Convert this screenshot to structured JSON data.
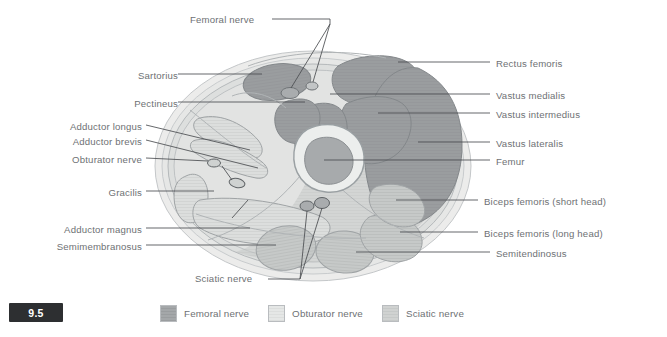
{
  "figure": {
    "number": "9.5",
    "title_alt": "Cross-section of the thigh showing nerve territories"
  },
  "labels_left": [
    {
      "name": "sartorius",
      "text": "Sartorius",
      "x": 118,
      "y": 77,
      "line_to_x": 262,
      "line_to_y": 82
    },
    {
      "name": "pectineus",
      "text": "Pectineus",
      "x": 120,
      "y": 105,
      "line_to_x": 300,
      "line_to_y": 109
    },
    {
      "name": "adductor-longus",
      "text": "Adductor longus",
      "x": 78,
      "y": 128,
      "line_to_x": 242,
      "line_to_y": 148
    },
    {
      "name": "adductor-brevis",
      "text": "Adductor brevis",
      "x": 79,
      "y": 143,
      "line_to_x": 252,
      "line_to_y": 163
    },
    {
      "name": "obturator-nerve",
      "text": "Obturator nerve",
      "x": 78,
      "y": 161,
      "line_to_x": 210,
      "line_to_y": 163
    },
    {
      "name": "gracilis",
      "text": "Gracilis",
      "x": 123,
      "y": 194,
      "line_to_x": 213,
      "line_to_y": 196
    },
    {
      "name": "adductor-magnus",
      "text": "Adductor magnus",
      "x": 70,
      "y": 231,
      "line_to_x": 248,
      "line_to_y": 234
    },
    {
      "name": "semimembranosus",
      "text": "Semimembranosus",
      "x": 66,
      "y": 248,
      "line_to_x": 272,
      "line_to_y": 250
    }
  ],
  "labels_right": [
    {
      "name": "rectus-femoris",
      "text": "Rectus femoris",
      "x": 500,
      "y": 65,
      "line_to_x": 420,
      "line_to_y": 68
    },
    {
      "name": "vastus-medialis",
      "text": "Vastus medialis",
      "x": 500,
      "y": 97,
      "line_to_x": 427,
      "line_to_y": 99
    },
    {
      "name": "vastus-intermedius",
      "text": "Vastus intermedius",
      "x": 500,
      "y": 116,
      "line_to_x": 418,
      "line_to_y": 118
    },
    {
      "name": "vastus-lateralis",
      "text": "Vastus lateralis",
      "x": 500,
      "y": 145,
      "line_to_x": 432,
      "line_to_y": 147
    },
    {
      "name": "femur",
      "text": "Femur",
      "x": 500,
      "y": 163,
      "line_to_x": 340,
      "line_to_y": 163
    },
    {
      "name": "biceps-femoris-short-head",
      "text": "Biceps femoris (short head)",
      "x": 489,
      "y": 203,
      "line_to_x": 408,
      "line_to_y": 205
    },
    {
      "name": "biceps-femoris-long-head",
      "text": "Biceps femoris (long head)",
      "x": 489,
      "y": 235,
      "line_to_x": 390,
      "line_to_y": 237
    },
    {
      "name": "semitendinosus",
      "text": "Semitendinosus",
      "x": 500,
      "y": 255,
      "line_to_x": 366,
      "line_to_y": 257
    }
  ],
  "labels_callout": [
    {
      "name": "femoral-nerve",
      "text": "Femoral nerve",
      "x": 190,
      "y": 22
    },
    {
      "name": "sciatic-nerve",
      "text": "Sciatic nerve",
      "x": 197,
      "y": 276
    }
  ],
  "legend": {
    "items": [
      {
        "name": "legend-femoral-nerve",
        "text": "Femoral nerve",
        "color": "#9a9d9f"
      },
      {
        "name": "legend-obturator-nerve",
        "text": "Obturator nerve",
        "color": "#dcdedd"
      },
      {
        "name": "legend-sciatic-nerve",
        "text": "Sciatic nerve",
        "color": "#c6c9c8"
      }
    ]
  },
  "palette": {
    "femoral_dark": "#9a9d9f",
    "femoral_mid": "#a8abad",
    "obturator_light": "#dcdedd",
    "sciatic_mid": "#c6c9c8",
    "skin_outer": "#ececeb",
    "fat_layer": "#e3e4e3",
    "fascia": "#d8dad9",
    "bone_cortex": "#e8eae9",
    "bone_marrow": "#a3a6a8",
    "outline": "#9aa0a3",
    "label_text": "#6e7174",
    "leader_line": "#4a4d50",
    "badge_bg": "#2d2f31"
  }
}
